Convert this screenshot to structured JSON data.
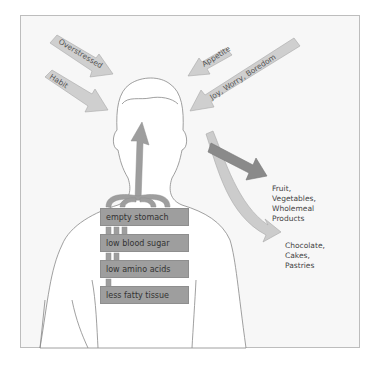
{
  "diagram": {
    "title": "",
    "colors": {
      "background": "#f7f7f7",
      "frame_border": "#bdbdbd",
      "input_arrow_fill": "#cfcfcf",
      "input_arrow_stroke": "#a8a8a8",
      "body_fill": "#ffffff",
      "body_stroke": "#888888",
      "factor_box_fill": "#9e9e9e",
      "dark_arrow_fill": "#8a8a8a",
      "light_arrow_fill": "#cccccc"
    },
    "input_arrows": [
      {
        "label": "Overstressed",
        "side": "left"
      },
      {
        "label": "Habit",
        "side": "left"
      },
      {
        "label": "Appetite",
        "side": "right"
      },
      {
        "label": "Joy, Worry, Boredom",
        "side": "right"
      }
    ],
    "physical_factors": [
      {
        "label": "empty stomach"
      },
      {
        "label": "low blood sugar"
      },
      {
        "label": "low amino acids"
      },
      {
        "label": "less fatty tissue"
      }
    ],
    "outputs": [
      {
        "label": "Fruit,\nVegetables,\nWholemeal\nProducts",
        "arrow": "dark-straight"
      },
      {
        "label": "Chocolate,\nCakes,\nPastries",
        "arrow": "light-curved"
      }
    ]
  }
}
